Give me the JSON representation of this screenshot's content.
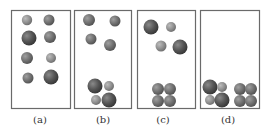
{
  "panels": [
    {
      "id": "a",
      "label": "(a)",
      "box": [
        11,
        10,
        59,
        98
      ],
      "label_x": 40,
      "balls": [
        [
          27,
          20,
          5.2,
          "light"
        ],
        [
          49,
          20,
          5.5,
          "mid"
        ],
        [
          29,
          38,
          7.5,
          "dark"
        ],
        [
          50,
          37,
          6,
          "mid"
        ],
        [
          27,
          58,
          6,
          "mid"
        ],
        [
          51,
          58,
          5,
          "light"
        ],
        [
          28,
          78,
          5.5,
          "mid"
        ],
        [
          51,
          77,
          7.5,
          "dark"
        ]
      ]
    },
    {
      "id": "b",
      "label": "(b)",
      "box": [
        74,
        10,
        57,
        98
      ],
      "label_x": 103,
      "balls": [
        [
          89,
          20,
          6,
          "mid"
        ],
        [
          115,
          21,
          5.5,
          "mid"
        ],
        [
          91,
          39,
          5.5,
          "mid"
        ],
        [
          110,
          45,
          6,
          "mid"
        ],
        [
          95,
          86,
          7.5,
          "dark"
        ],
        [
          109,
          86,
          5,
          "light"
        ],
        [
          96,
          100,
          5,
          "light"
        ],
        [
          109,
          100,
          7.5,
          "dark"
        ]
      ]
    },
    {
      "id": "c",
      "label": "(c)",
      "box": [
        137,
        10,
        58,
        98
      ],
      "label_x": 163,
      "balls": [
        [
          151,
          27,
          7.5,
          "dark"
        ],
        [
          171,
          27,
          5,
          "light"
        ],
        [
          161,
          46,
          5.5,
          "light"
        ],
        [
          180,
          47,
          7.5,
          "dark"
        ],
        [
          158,
          89,
          6,
          "mid"
        ],
        [
          170,
          89,
          6,
          "mid"
        ],
        [
          158,
          101,
          6,
          "mid"
        ],
        [
          170,
          101,
          6,
          "mid"
        ]
      ]
    },
    {
      "id": "d",
      "label": "(d)",
      "box": [
        200,
        10,
        59,
        98
      ],
      "label_x": 228,
      "balls": [
        [
          210,
          87,
          7.5,
          "dark"
        ],
        [
          222,
          87,
          5,
          "light"
        ],
        [
          210,
          100,
          5,
          "light"
        ],
        [
          222,
          100,
          7.5,
          "dark"
        ],
        [
          240,
          89,
          6,
          "mid"
        ],
        [
          251,
          89,
          6,
          "mid"
        ],
        [
          240,
          101,
          6,
          "mid"
        ],
        [
          251,
          101,
          6,
          "mid"
        ]
      ]
    }
  ],
  "colors": {
    "border": "#6a6a6a",
    "dark": "#5a5a5a",
    "mid": "#7a7a7a",
    "light": "#9a9a9a"
  }
}
